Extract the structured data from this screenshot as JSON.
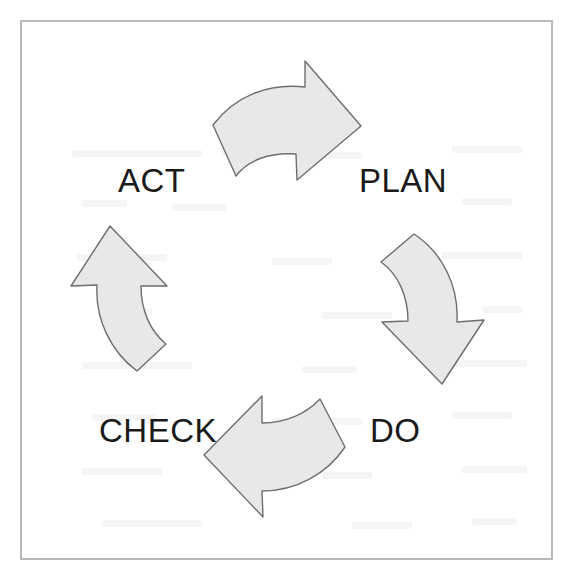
{
  "figure": {
    "type": "cyclic-process-diagram",
    "background_color": "#ffffff",
    "frame": {
      "name": "outer-border",
      "border_color": "#b9b9b9",
      "border_width_px": 2
    },
    "arrow_style": {
      "fill_color": "#e8e8e8",
      "stroke_color": "#6e6e6e",
      "stroke_width_px": 1.4
    },
    "label_color": "#1a1a1a",
    "label_font_size_px": 33,
    "rotation_direction": "clockwise",
    "stages": [
      {
        "id": "plan",
        "label": "PLAN",
        "position": "top-right",
        "arrow": {
          "name": "arrow-top-right",
          "points_toward": "PLAN",
          "direction": "right"
        }
      },
      {
        "id": "do",
        "label": "DO",
        "position": "bottom-right",
        "arrow": {
          "name": "arrow-right-down",
          "points_toward": "DO",
          "direction": "down"
        }
      },
      {
        "id": "check",
        "label": "CHECK",
        "position": "bottom-left",
        "arrow": {
          "name": "arrow-bottom-left",
          "points_toward": "CHECK",
          "direction": "left"
        }
      },
      {
        "id": "act",
        "label": "ACT",
        "position": "top-left",
        "arrow": {
          "name": "arrow-left-up",
          "points_toward": "ACT",
          "direction": "up"
        }
      }
    ]
  }
}
